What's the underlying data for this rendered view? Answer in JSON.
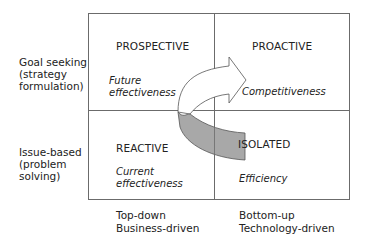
{
  "diagram": {
    "rows": [
      {
        "label_lines": [
          "Goal seeking",
          "(strategy",
          "formulation)"
        ]
      },
      {
        "label_lines": [
          "Issue-based",
          "(problem",
          "solving)"
        ]
      }
    ],
    "columns": [
      {
        "label_lines": [
          "Top-down",
          "Business-driven"
        ]
      },
      {
        "label_lines": [
          "Bottom-up",
          "Technology-driven"
        ]
      }
    ],
    "quadrants": {
      "top_left": {
        "title": "PROSPECTIVE",
        "subtitle_lines": [
          "Future",
          "effectiveness"
        ]
      },
      "top_right": {
        "title": "PROACTIVE",
        "subtitle_lines": [
          "Competitiveness"
        ]
      },
      "bottom_left": {
        "title": "REACTIVE",
        "subtitle_lines": [
          "Current",
          "effectiveness"
        ]
      },
      "bottom_right": {
        "title": "ISOLATED",
        "subtitle_lines": [
          "Efficiency"
        ]
      }
    },
    "arrow": {
      "description": "curved arrow from ISOLATED through REACTIVE/PROSPECTIVE boundary to PROACTIVE",
      "shaded_fill": "#a8a8a8",
      "outline": "#555555"
    },
    "colors": {
      "border": "#6b6b6b",
      "background": "#ffffff",
      "text": "#222222"
    }
  }
}
